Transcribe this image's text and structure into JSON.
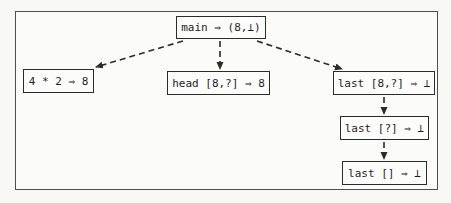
{
  "diagram": {
    "nodes": {
      "main": {
        "label": "main ⇒ (8,⊥)"
      },
      "mul": {
        "label": "4 * 2 ⇒ 8"
      },
      "head": {
        "label": "head [8,?] ⇒ 8"
      },
      "last1": {
        "label": "last [8,?] ⇒ ⊥"
      },
      "last2": {
        "label": "last [?] ⇒ ⊥"
      },
      "last3": {
        "label": "last [] ⇒ ⊥"
      }
    },
    "edges": [
      {
        "from": "main",
        "to": "mul",
        "style": "dashed-arrow"
      },
      {
        "from": "main",
        "to": "head",
        "style": "dashed-arrow"
      },
      {
        "from": "main",
        "to": "last1",
        "style": "dashed-arrow"
      },
      {
        "from": "last1",
        "to": "last2",
        "style": "dashed-arrow"
      },
      {
        "from": "last2",
        "to": "last3",
        "style": "dashed-arrow"
      }
    ],
    "colors": {
      "background": "#f8f8f5",
      "frame_border": "#4f4f4f",
      "node_border": "#2b2b2b",
      "text": "#1e1e1e",
      "arrow": "#2b2b2b"
    }
  }
}
